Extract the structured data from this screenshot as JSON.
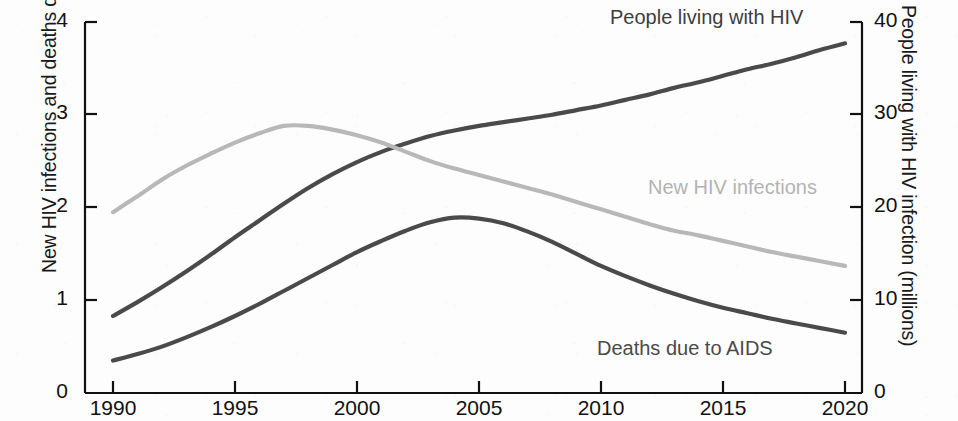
{
  "chart_data": {
    "type": "line",
    "title": "",
    "subtitle": "",
    "xlabel": "",
    "ylabel": "New HIV infections and deaths due to AIDS (millions)",
    "ylabel_right": "People living with HIV infection (millions)",
    "xlim": [
      1990,
      2020
    ],
    "ylim": [
      0,
      4
    ],
    "ylim_right": [
      0,
      40
    ],
    "xticks": [
      "1990",
      "1995",
      "2000",
      "2005",
      "2010",
      "2015",
      "2020"
    ],
    "yticks_left": [
      "0",
      "1",
      "2",
      "3",
      "4"
    ],
    "yticks_right": [
      "0",
      "10",
      "20",
      "30",
      "40"
    ],
    "grid": false,
    "legend_position": "inline-annotations",
    "x": [
      1990,
      1991,
      1992,
      1993,
      1994,
      1995,
      1996,
      1997,
      1998,
      1999,
      2000,
      2001,
      2002,
      2003,
      2004,
      2005,
      2006,
      2007,
      2008,
      2009,
      2010,
      2011,
      2012,
      2013,
      2014,
      2015,
      2016,
      2017,
      2018,
      2019,
      2020
    ],
    "series": [
      {
        "name": "People living with HIV",
        "axis": "right",
        "units": "millions",
        "color": "#4a4a4a",
        "values": [
          8.3,
          9.8,
          11.4,
          13.1,
          14.9,
          16.8,
          18.6,
          20.4,
          22.1,
          23.6,
          24.9,
          26.0,
          26.9,
          27.7,
          28.3,
          28.8,
          29.2,
          29.6,
          30.0,
          30.5,
          31.0,
          31.6,
          32.2,
          32.9,
          33.5,
          34.2,
          34.9,
          35.5,
          36.2,
          37.0,
          37.7
        ]
      },
      {
        "name": "New HIV infections",
        "axis": "left",
        "units": "millions",
        "color": "#b8b8b8",
        "values": [
          1.95,
          2.12,
          2.3,
          2.45,
          2.58,
          2.7,
          2.8,
          2.88,
          2.88,
          2.84,
          2.78,
          2.7,
          2.6,
          2.5,
          2.42,
          2.35,
          2.28,
          2.21,
          2.14,
          2.06,
          1.98,
          1.9,
          1.82,
          1.75,
          1.7,
          1.64,
          1.58,
          1.52,
          1.47,
          1.42,
          1.37
        ]
      },
      {
        "name": "Deaths due to AIDS",
        "axis": "left",
        "units": "millions",
        "color": "#4a4a4a",
        "values": [
          0.35,
          0.42,
          0.5,
          0.6,
          0.71,
          0.83,
          0.96,
          1.1,
          1.24,
          1.38,
          1.52,
          1.64,
          1.75,
          1.84,
          1.89,
          1.88,
          1.83,
          1.74,
          1.63,
          1.5,
          1.37,
          1.26,
          1.16,
          1.07,
          0.99,
          0.92,
          0.86,
          0.8,
          0.75,
          0.7,
          0.65
        ]
      }
    ],
    "annotations": [
      {
        "text": "People living with HIV",
        "color": "#3d3d3d"
      },
      {
        "text": "New HIV infections",
        "color": "#b3b3b3"
      },
      {
        "text": "Deaths due to AIDS",
        "color": "#4a4a4a"
      }
    ]
  },
  "axes": {
    "left_title": "New HIV infections and deaths due to AIDS (millions)",
    "right_title": "People living with HIV infection (millions)",
    "left_ticks": [
      "4",
      "3",
      "2",
      "1",
      "0"
    ],
    "right_ticks": [
      "40",
      "30",
      "20",
      "10",
      "0"
    ],
    "x_ticks": [
      "1990",
      "1995",
      "2000",
      "2005",
      "2010",
      "2015",
      "2020"
    ]
  },
  "labels": {
    "plhiv": "People living with HIV",
    "new_infections": "New HIV infections",
    "deaths": "Deaths due to AIDS"
  },
  "colors": {
    "dark_line": "#4a4a4a",
    "light_line": "#b8b8b8",
    "axis": "#111111",
    "background": "#fdfdfd"
  }
}
